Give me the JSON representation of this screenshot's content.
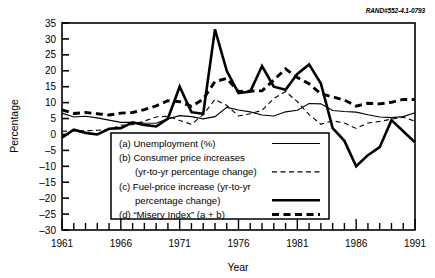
{
  "figure": {
    "rand_id": "RAND#552-4.1-0793"
  },
  "chart_data": {
    "type": "line",
    "title": "",
    "xlabel": "Year",
    "ylabel": "Percentage",
    "xlim": [
      1961,
      1991
    ],
    "ylim": [
      -30,
      35
    ],
    "ytick_step": 5,
    "yticks": [
      -30,
      -25,
      -20,
      -15,
      -10,
      -5,
      0,
      5,
      10,
      15,
      20,
      25,
      30,
      35
    ],
    "ytick_labels": [
      "–30",
      "–25",
      "–20",
      "–15",
      "–10",
      "–5",
      "0",
      "5",
      "10",
      "15",
      "20",
      "25",
      "30",
      "35"
    ],
    "xticks": [
      1961,
      1962,
      1963,
      1964,
      1965,
      1966,
      1967,
      1968,
      1969,
      1970,
      1971,
      1972,
      1973,
      1974,
      1975,
      1976,
      1977,
      1978,
      1979,
      1980,
      1981,
      1982,
      1983,
      1984,
      1985,
      1986,
      1987,
      1988,
      1989,
      1990,
      1991
    ],
    "xtick_labels_shown": [
      "1961",
      "1966",
      "1971",
      "1976",
      "1981",
      "1986",
      "1991"
    ],
    "xtick_label_years": [
      1961,
      1966,
      1971,
      1976,
      1981,
      1986,
      1991
    ],
    "grid": false,
    "legend_position": "lower-center-inset",
    "x": [
      1961,
      1962,
      1963,
      1964,
      1965,
      1966,
      1967,
      1968,
      1969,
      1970,
      1971,
      1972,
      1973,
      1974,
      1975,
      1976,
      1977,
      1978,
      1979,
      1980,
      1981,
      1982,
      1983,
      1984,
      1985,
      1986,
      1987,
      1988,
      1989,
      1990,
      1991
    ],
    "series": [
      {
        "name": "(a) Unemployment (%)",
        "key": "unemployment",
        "style": "thin-solid",
        "values": [
          6.7,
          5.5,
          5.7,
          5.2,
          4.5,
          3.8,
          3.8,
          3.6,
          3.5,
          4.9,
          5.9,
          5.6,
          4.9,
          5.6,
          8.5,
          7.7,
          7.1,
          6.1,
          5.8,
          7.1,
          7.6,
          9.7,
          9.6,
          7.5,
          7.2,
          7.0,
          6.2,
          5.5,
          5.3,
          5.6,
          6.8
        ]
      },
      {
        "name": "(b) Consumer price increases (yr-to-yr percentage change)",
        "key": "cpi",
        "style": "thin-dashed",
        "values": [
          1.0,
          1.1,
          1.2,
          1.3,
          1.6,
          2.9,
          3.1,
          4.2,
          5.5,
          5.7,
          4.4,
          3.2,
          6.2,
          11.0,
          9.1,
          5.8,
          6.5,
          7.6,
          11.3,
          13.5,
          10.3,
          6.2,
          3.2,
          4.3,
          3.6,
          1.9,
          3.6,
          4.1,
          4.8,
          5.4,
          4.2
        ]
      },
      {
        "name": "(c) Fuel-price increase (yr-to-yr percentage change)",
        "key": "fuel",
        "style": "thick-solid",
        "values": [
          -1.0,
          1.5,
          0.5,
          0.0,
          1.8,
          2.0,
          3.8,
          3.0,
          2.5,
          5.0,
          15.0,
          7.0,
          6.5,
          33.0,
          20.0,
          13.0,
          13.5,
          21.5,
          15.0,
          14.0,
          19.0,
          22.0,
          16.0,
          2.0,
          -2.0,
          -10.0,
          -6.5,
          -4.0,
          4.5,
          1.0,
          -2.5
        ]
      },
      {
        "name": "(d) “Misery Index” (a + b)",
        "key": "misery",
        "style": "thick-dashed",
        "values": [
          7.7,
          6.6,
          6.9,
          6.5,
          6.1,
          6.7,
          6.9,
          7.8,
          9.0,
          10.6,
          10.3,
          8.8,
          11.1,
          16.6,
          17.6,
          13.5,
          13.6,
          13.7,
          17.1,
          20.6,
          17.9,
          15.9,
          12.8,
          11.8,
          10.8,
          8.9,
          9.8,
          9.6,
          10.1,
          11.0,
          11.0
        ]
      }
    ],
    "legend": [
      {
        "lines": [
          "(a) Unemployment (%)"
        ],
        "swatch": "thin-solid",
        "swatch_line_index": 0
      },
      {
        "lines": [
          "(b) Consumer price increases",
          "(yr-to-yr percentage change)"
        ],
        "swatch": "thin-dashed",
        "swatch_line_index": 1
      },
      {
        "lines": [
          "(c) Fuel-price increase (yr-to-yr",
          "percentage change)"
        ],
        "swatch": "thick-solid",
        "swatch_line_index": 1
      },
      {
        "lines": [
          "(d) “Misery Index” (a + b)"
        ],
        "swatch": "thick-dashed",
        "swatch_line_index": 0
      }
    ],
    "colors": {
      "line": "#000000",
      "axis": "#000000",
      "background": "#ffffff"
    }
  }
}
